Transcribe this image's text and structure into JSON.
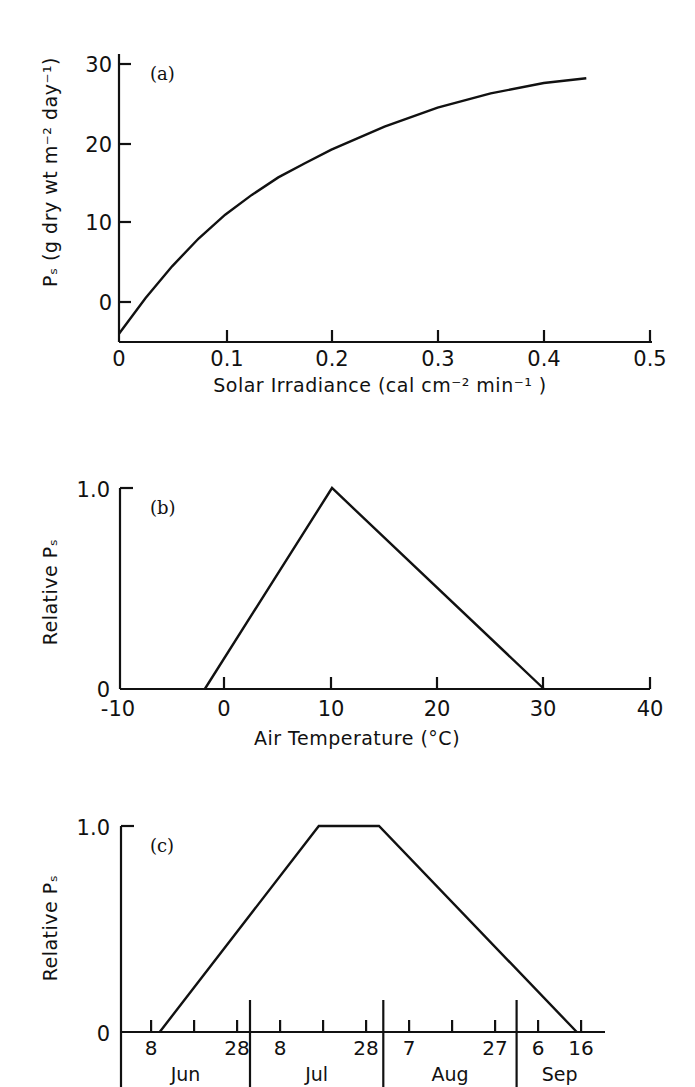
{
  "figure": {
    "header_fragment": "",
    "colors": {
      "ink": "#111111",
      "background": "#ffffff"
    }
  },
  "chart_data": [
    {
      "id": "a",
      "panel_label": "(a)",
      "type": "line",
      "title": "",
      "xlabel": "Solar Irradiance (cal cm⁻² min⁻¹ )",
      "ylabel": "Pₛ   (g dry wt m⁻² day⁻¹)",
      "xlim": [
        0,
        0.5
      ],
      "ylim": [
        -5,
        30
      ],
      "x_ticks": [
        0,
        0.1,
        0.2,
        0.3,
        0.4,
        0.5
      ],
      "x_tick_labels": [
        "0",
        "0.1",
        "0.2",
        "0.3",
        "0.4",
        "0.5"
      ],
      "y_ticks": [
        0,
        10,
        20,
        30
      ],
      "y_tick_labels": [
        "0",
        "10",
        "20",
        "30"
      ],
      "grid": false,
      "legend": null,
      "series": [
        {
          "name": "Ps vs irradiance",
          "x": [
            0,
            0.025,
            0.05,
            0.075,
            0.1,
            0.125,
            0.15,
            0.175,
            0.2,
            0.25,
            0.3,
            0.35,
            0.4,
            0.44
          ],
          "y": [
            -4,
            0.5,
            4.5,
            8,
            11,
            13.5,
            15.7,
            17.5,
            19.2,
            22.1,
            24.5,
            26.3,
            27.6,
            28.2
          ]
        }
      ]
    },
    {
      "id": "b",
      "panel_label": "(b)",
      "type": "line",
      "title": "",
      "xlabel": "Air Temperature (°C)",
      "ylabel": "Relative Pₛ",
      "xlim": [
        -10,
        40
      ],
      "ylim": [
        0,
        1.0
      ],
      "x_ticks": [
        -10,
        0,
        10,
        20,
        30,
        40
      ],
      "x_tick_labels": [
        "-10",
        "0",
        "10",
        "20",
        "30",
        "40"
      ],
      "y_ticks": [
        0,
        1.0
      ],
      "y_tick_labels": [
        "0",
        "1.0"
      ],
      "grid": false,
      "legend": null,
      "series": [
        {
          "name": "Relative Ps vs temperature",
          "x": [
            -2,
            10,
            30
          ],
          "y": [
            0,
            1.0,
            0
          ]
        }
      ]
    },
    {
      "id": "c",
      "panel_label": "(c)",
      "type": "line",
      "title": "",
      "xlabel": "",
      "ylabel": "Relative Pₛ",
      "x_unit": "day of season (Jun 1 = 0)",
      "xlim": [
        0,
        112
      ],
      "ylim": [
        0,
        1.0
      ],
      "x_ticks": [
        7,
        17,
        27,
        37,
        47,
        57,
        67,
        77,
        87,
        97,
        107
      ],
      "x_tick_labels": [
        "8",
        "",
        "28",
        "8",
        "",
        "28",
        "7",
        "",
        "27",
        "6",
        "16"
      ],
      "months": [
        {
          "label": "Jun",
          "start": 0,
          "end": 30
        },
        {
          "label": "Jul",
          "start": 30,
          "end": 61
        },
        {
          "label": "Aug",
          "start": 61,
          "end": 92
        },
        {
          "label": "Sep",
          "start": 92,
          "end": 112
        }
      ],
      "y_ticks": [
        0,
        1.0
      ],
      "y_tick_labels": [
        "0",
        "1.0"
      ],
      "grid": false,
      "legend": null,
      "series": [
        {
          "name": "Relative Ps vs date",
          "x": [
            9,
            46,
            60,
            106
          ],
          "x_dates": [
            "Jun 10",
            "Jul 17",
            "Jul 31",
            "Sep 15"
          ],
          "y": [
            0,
            1.0,
            1.0,
            0
          ]
        }
      ]
    }
  ]
}
